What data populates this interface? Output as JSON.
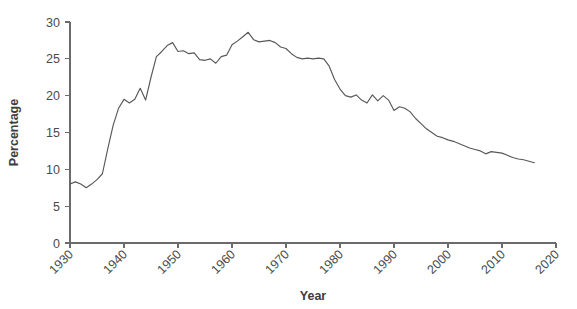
{
  "chart_data": {
    "type": "line",
    "title": "",
    "xlabel": "Year",
    "ylabel": "Percentage",
    "xlim": [
      1930,
      2020
    ],
    "ylim": [
      0,
      30
    ],
    "xticks": [
      1930,
      1940,
      1950,
      1960,
      1970,
      1980,
      1990,
      2000,
      2010,
      2020
    ],
    "yticks": [
      0,
      5,
      10,
      15,
      20,
      25,
      30
    ],
    "xtick_labels": [
      "1930",
      "1940",
      "1950",
      "1960",
      "1970",
      "1980",
      "1990",
      "2000",
      "2010",
      "2020"
    ],
    "ytick_labels": [
      "0",
      "5",
      "10",
      "15",
      "20",
      "25",
      "30"
    ],
    "grid": false,
    "legend": false,
    "line_color": "#585858",
    "axis_color": "#6b6b6b",
    "background_color": "#ffffff",
    "series": [
      {
        "name": "Percentage",
        "x": [
          1930,
          1931,
          1932,
          1933,
          1934,
          1935,
          1936,
          1937,
          1938,
          1939,
          1940,
          1941,
          1942,
          1943,
          1944,
          1945,
          1946,
          1947,
          1948,
          1949,
          1950,
          1951,
          1952,
          1953,
          1954,
          1955,
          1956,
          1957,
          1958,
          1959,
          1960,
          1961,
          1962,
          1963,
          1964,
          1965,
          1966,
          1967,
          1968,
          1969,
          1970,
          1971,
          1972,
          1973,
          1974,
          1975,
          1976,
          1977,
          1978,
          1979,
          1980,
          1981,
          1982,
          1983,
          1984,
          1985,
          1986,
          1987,
          1988,
          1989,
          1990,
          1991,
          1992,
          1993,
          1994,
          1995,
          1996,
          1997,
          1998,
          1999,
          2000,
          2001,
          2002,
          2003,
          2004,
          2005,
          2006,
          2007,
          2008,
          2009,
          2010,
          2011,
          2012,
          2013,
          2014,
          2015,
          2016
        ],
        "values": [
          8.0,
          8.3,
          8.0,
          7.5,
          8.0,
          8.6,
          9.4,
          12.8,
          16.0,
          18.3,
          19.5,
          19.0,
          19.5,
          21.0,
          19.4,
          22.5,
          25.3,
          26.0,
          26.8,
          27.2,
          26.0,
          26.1,
          25.7,
          25.8,
          24.9,
          24.8,
          25.0,
          24.4,
          25.3,
          25.5,
          26.9,
          27.4,
          28.0,
          28.6,
          27.6,
          27.3,
          27.4,
          27.5,
          27.2,
          26.6,
          26.4,
          25.7,
          25.2,
          25.0,
          25.1,
          25.0,
          25.1,
          25.0,
          24.0,
          22.2,
          20.9,
          20.0,
          19.8,
          20.1,
          19.4,
          19.0,
          20.1,
          19.3,
          20.0,
          19.4,
          18.0,
          18.5,
          18.3,
          17.8,
          16.9,
          16.2,
          15.5,
          15.0,
          14.5,
          14.3,
          14.0,
          13.8,
          13.5,
          13.2,
          12.9,
          12.7,
          12.5,
          12.1,
          12.4,
          12.3,
          12.2,
          11.9,
          11.6,
          11.4,
          11.3,
          11.1,
          10.9
        ]
      }
    ]
  }
}
